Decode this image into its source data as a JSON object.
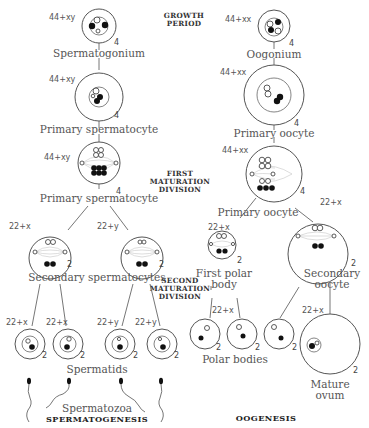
{
  "headers": {
    "growth_period": [
      "GROWTH",
      "PERIOD"
    ],
    "first_maturation": [
      "FIRST",
      "MATURATION",
      "DIVISION"
    ],
    "second_maturation": [
      "SECOND",
      "MATURATION",
      "DIVISION"
    ],
    "spermatogenesis": "SPERMATOGENESIS",
    "oogenesis": "OOGENESIS"
  },
  "spermatogenesis": {
    "spermatogonium": {
      "label": "Spermatogonium",
      "chromosomes": "44+xy",
      "count": "4"
    },
    "primary_spermatocyte_growth": {
      "label": "Primary spermatocyte",
      "chromosomes": "44+xy",
      "count": "4"
    },
    "primary_spermatocyte_division": {
      "label": "Primary spermatocyte",
      "chromosomes": "44+xy",
      "count": "4"
    },
    "secondary_spermatocytes": {
      "label": "Secondary spermatocytes",
      "cells": [
        {
          "chromosomes": "22+x",
          "count": "2"
        },
        {
          "chromosomes": "22+y",
          "count": "2"
        }
      ]
    },
    "spermatids": {
      "label": "Spermatids",
      "cells": [
        {
          "chromosomes": "22+x",
          "count": "2"
        },
        {
          "chromosomes": "22+x",
          "count": "2"
        },
        {
          "chromosomes": "22+y",
          "count": "2"
        },
        {
          "chromosomes": "22+y",
          "count": "2"
        }
      ]
    },
    "spermatozoa": {
      "label": "Spermatozoa"
    }
  },
  "oogenesis": {
    "oogonium": {
      "label": "Oogonium",
      "chromosomes": "44+xx",
      "count": "4"
    },
    "primary_oocyte_growth": {
      "label": "Primary oocyte",
      "chromosomes": "44+xx",
      "count": "4"
    },
    "primary_oocyte_division": {
      "label": "Primary oocyte",
      "chromosomes": "44+xx",
      "count": "4"
    },
    "first_polar_body": {
      "label_line1": "First polar",
      "label_line2": "body",
      "chromosomes": "22+x",
      "count": "2"
    },
    "secondary_oocyte": {
      "label_line1": "Secondary",
      "label_line2": "oocyte",
      "chromosomes": "22+x",
      "count": "2"
    },
    "polar_bodies": {
      "label": "Polar bodies",
      "chromosomes": "22+x",
      "counts": [
        "2",
        "2",
        "2"
      ]
    },
    "mature_ovum": {
      "label_line1": "Mature",
      "label_line2": "ovum",
      "chromosomes": "22+x",
      "count": "2"
    }
  }
}
